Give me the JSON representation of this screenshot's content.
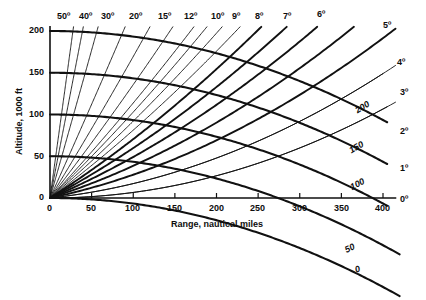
{
  "chart_data": {
    "type": "line",
    "title": "",
    "xlabel": "Range, nautical miles",
    "ylabel": "Altitude, 1000 ft",
    "xlim": [
      0,
      430
    ],
    "ylim": [
      0,
      210
    ],
    "xticks": [
      0,
      50,
      100,
      150,
      200,
      250,
      300,
      350,
      400
    ],
    "yticks": [
      0,
      50,
      100,
      150,
      200
    ],
    "grid": false,
    "legend_position": "inline-end-labels",
    "elevation_radials": {
      "unit": "degrees",
      "labels_top": [
        "50º",
        "40º",
        "30º",
        "20º",
        "15º",
        "12º",
        "10º",
        "9º",
        "8º",
        "7º",
        "6º"
      ],
      "labels_right": [
        "5º",
        "4º",
        "3º",
        "2º",
        "1º",
        "0º"
      ],
      "values": [
        50,
        40,
        30,
        20,
        15,
        12,
        10,
        9,
        8,
        7,
        6,
        5,
        4,
        3,
        2,
        1,
        0
      ]
    },
    "altitude_contours": {
      "unit": "1000 ft",
      "values": [
        200,
        150,
        100,
        50,
        0
      ],
      "inline_labels": [
        "200",
        "150",
        "100",
        "50",
        "0"
      ]
    },
    "series": [
      {
        "name": "50º radial",
        "angle": 50
      },
      {
        "name": "40º radial",
        "angle": 40
      },
      {
        "name": "30º radial",
        "angle": 30
      },
      {
        "name": "20º radial",
        "angle": 20
      },
      {
        "name": "15º radial",
        "angle": 15
      },
      {
        "name": "12º radial",
        "angle": 12
      },
      {
        "name": "10º radial",
        "angle": 10
      },
      {
        "name": "9º radial",
        "angle": 9
      },
      {
        "name": "8º radial",
        "angle": 8
      },
      {
        "name": "7º radial",
        "angle": 7
      },
      {
        "name": "6º radial",
        "angle": 6
      },
      {
        "name": "5º radial",
        "angle": 5
      },
      {
        "name": "4º radial",
        "angle": 4
      },
      {
        "name": "3º radial",
        "angle": 3
      },
      {
        "name": "2º radial",
        "angle": 2
      },
      {
        "name": "1º radial",
        "angle": 1
      },
      {
        "name": "0º radial",
        "angle": 0
      },
      {
        "name": "200 kft contour",
        "altitude": 200
      },
      {
        "name": "150 kft contour",
        "altitude": 150
      },
      {
        "name": "100 kft contour",
        "altitude": 100
      },
      {
        "name": "50 kft contour",
        "altitude": 50
      },
      {
        "name": "0 kft contour",
        "altitude": 0
      }
    ]
  },
  "axes": {
    "x_title": "Range, nautical miles",
    "y_title": "Altitude, 1000 ft",
    "x_tick_labels": [
      "0",
      "50",
      "100",
      "150",
      "200",
      "250",
      "300",
      "350",
      "400"
    ],
    "y_tick_labels": [
      "200",
      "150",
      "100",
      "50",
      "0"
    ],
    "origin_label": "0"
  },
  "angle_labels_top": [
    {
      "text": "50º"
    },
    {
      "text": "40º"
    },
    {
      "text": "30º"
    },
    {
      "text": "20º"
    },
    {
      "text": "15º"
    },
    {
      "text": "12º"
    },
    {
      "text": "10º"
    },
    {
      "text": "9º"
    },
    {
      "text": "8º"
    },
    {
      "text": "7º"
    },
    {
      "text": "6º"
    }
  ],
  "angle_labels_right": [
    {
      "text": "5º"
    },
    {
      "text": "4º"
    },
    {
      "text": "3º"
    },
    {
      "text": "2º"
    },
    {
      "text": "1º"
    },
    {
      "text": "0º"
    }
  ],
  "contour_labels": [
    {
      "text": "200"
    },
    {
      "text": "150"
    },
    {
      "text": "100"
    },
    {
      "text": "50"
    },
    {
      "text": "0"
    }
  ],
  "colors": {
    "ink": "#0d0d0d",
    "background": "#ffffff"
  }
}
